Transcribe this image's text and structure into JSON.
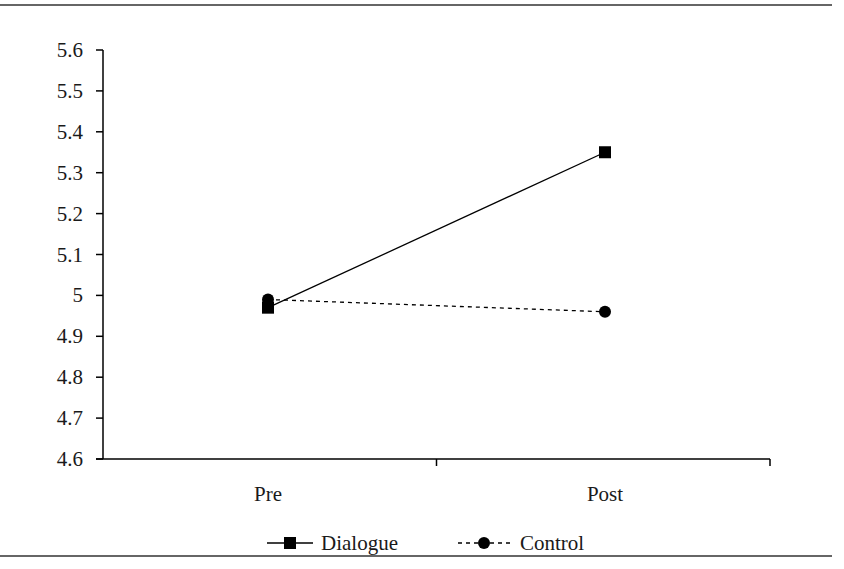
{
  "chart_data": {
    "type": "line",
    "title": "",
    "xlabel": "",
    "ylabel": "",
    "categories": [
      "Pre",
      "Post"
    ],
    "series": [
      {
        "name": "Dialogue",
        "values": [
          4.97,
          5.35
        ],
        "marker": "square",
        "line_style": "solid",
        "color": "#000000"
      },
      {
        "name": "Control",
        "values": [
          4.99,
          4.96
        ],
        "marker": "circle",
        "line_style": "dashed",
        "color": "#000000"
      }
    ],
    "ylim": [
      4.6,
      5.6
    ],
    "yticks": [
      5.6,
      5.5,
      5.4,
      5.3,
      5.2,
      5.1,
      5,
      4.9,
      4.8,
      4.7,
      4.6
    ],
    "ytick_labels": [
      "5.6",
      "5.5",
      "5.4",
      "5.3",
      "5.2",
      "5.1",
      "5",
      "4.9",
      "4.8",
      "4.7",
      "4.6"
    ],
    "grid": false,
    "legend_position": "bottom"
  },
  "legend": {
    "items": [
      {
        "label": "Dialogue"
      },
      {
        "label": "Control"
      }
    ]
  },
  "colors": {
    "ink": "#000000",
    "rule": "#333333"
  }
}
